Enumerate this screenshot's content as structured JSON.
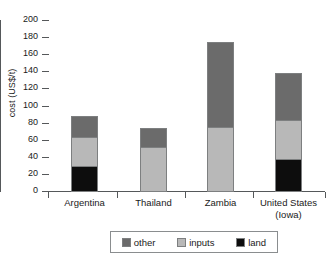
{
  "chart_data": {
    "type": "bar",
    "subtype": "stacked-vertical",
    "title": "",
    "xlabel": "",
    "ylabel": "cost (US$/t)",
    "ylim": [
      0,
      200
    ],
    "ytick_step": 20,
    "yticks": [
      200,
      180,
      160,
      140,
      120,
      100,
      80,
      60,
      40,
      20,
      0
    ],
    "grid": false,
    "legend_position": "bottom",
    "categories": [
      "Argentina",
      "Thailand",
      "Zambia",
      "United States (Iowa)"
    ],
    "category_lines": [
      [
        "Argentina"
      ],
      [
        "Thailand"
      ],
      [
        "Zambia"
      ],
      [
        "United States",
        "(Iowa)"
      ]
    ],
    "series": [
      {
        "name": "land",
        "color": "#0d0d0d",
        "values": [
          29,
          0,
          0,
          38
        ]
      },
      {
        "name": "inputs",
        "color": "#b8b8b8",
        "values": [
          34,
          51,
          75,
          45
        ]
      },
      {
        "name": "other",
        "color": "#6b6b6b",
        "values": [
          25,
          23,
          99,
          55
        ]
      }
    ],
    "totals": [
      88,
      74,
      174,
      138
    ],
    "stack_boundaries": [
      [
        0,
        29,
        63,
        88
      ],
      [
        0,
        0,
        51,
        74
      ],
      [
        0,
        0,
        75,
        174
      ],
      [
        0,
        38,
        83,
        138
      ]
    ]
  },
  "legend": {
    "items": [
      {
        "label": "other",
        "color": "#6b6b6b"
      },
      {
        "label": "inputs",
        "color": "#b8b8b8"
      },
      {
        "label": "land",
        "color": "#0d0d0d"
      }
    ]
  },
  "axis": {
    "y_title": "cost (US$/t)",
    "y_labels": [
      "200",
      "180",
      "160",
      "140",
      "120",
      "100",
      "80",
      "60",
      "40",
      "20",
      "0"
    ]
  },
  "colors": {
    "other": "#6b6b6b",
    "inputs": "#b8b8b8",
    "land": "#0d0d0d",
    "axis": "#55585a",
    "text": "#1a1a1a",
    "background": "#ffffff"
  }
}
